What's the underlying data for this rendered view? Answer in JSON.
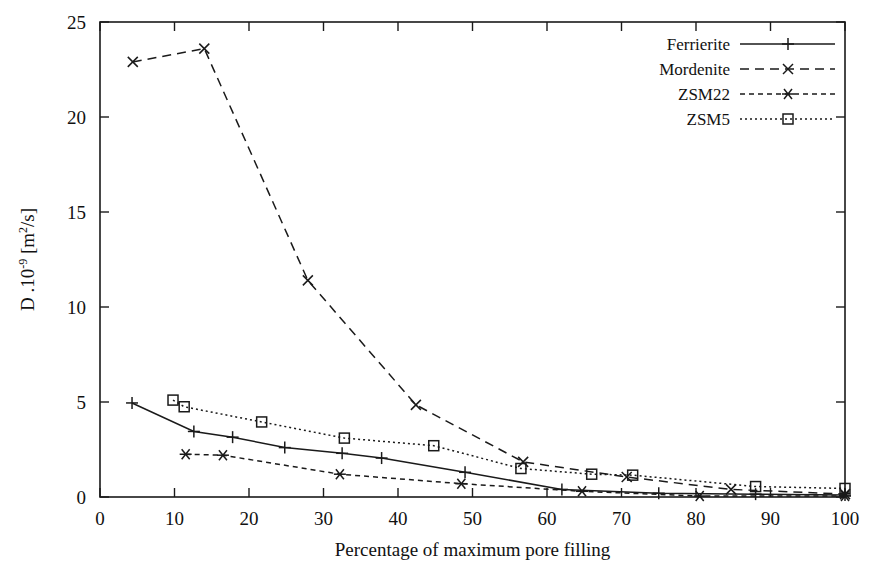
{
  "chart_data": {
    "type": "line",
    "title": "",
    "subtitle": "",
    "xlabel": "Percentage of maximum pore filling",
    "ylabel": "D .10-9 [m2/s]",
    "ylabel_parts": {
      "lead": "D .10",
      "exp": "-9",
      "tail": " [m",
      "unit_exp": "2",
      "unit_tail": "/s]"
    },
    "xlim": [
      0,
      100
    ],
    "ylim": [
      0,
      25
    ],
    "xticks": [
      0,
      10,
      20,
      30,
      40,
      50,
      60,
      70,
      80,
      90,
      100
    ],
    "yticks": [
      0,
      5,
      10,
      15,
      20,
      25
    ],
    "xtick_labels": [
      "0",
      "10",
      "20",
      "30",
      "40",
      "50",
      "60",
      "70",
      "80",
      "90",
      "100"
    ],
    "ytick_labels": [
      "0",
      "5",
      "10",
      "15",
      "20",
      "25"
    ],
    "grid": false,
    "legend_position": "top-right",
    "frame": true,
    "series": [
      {
        "name": "Ferrierite",
        "style": "solid",
        "marker": "plus",
        "color": "#1a1a1a",
        "x": [
          4.3,
          12.6,
          17.8,
          24.8,
          32.5,
          37.8,
          49.0,
          62.0,
          75.0,
          88.0,
          100.0
        ],
        "y": [
          4.95,
          3.45,
          3.15,
          2.6,
          2.3,
          2.05,
          1.3,
          0.4,
          0.2,
          0.15,
          0.1
        ]
      },
      {
        "name": "Mordenite",
        "style": "dashed",
        "marker": "cross",
        "color": "#1a1a1a",
        "x": [
          4.4,
          14.0,
          27.9,
          42.4,
          56.8,
          70.7,
          84.7,
          100.0
        ],
        "y": [
          22.9,
          23.6,
          11.4,
          4.85,
          1.85,
          1.05,
          0.4,
          0.15
        ]
      },
      {
        "name": "ZSM22",
        "style": "dashed-fine",
        "marker": "asterisk",
        "color": "#1a1a1a",
        "x": [
          11.5,
          16.5,
          32.2,
          48.5,
          64.7,
          80.5,
          100.0
        ],
        "y": [
          2.25,
          2.2,
          1.2,
          0.7,
          0.3,
          0.05,
          0.05
        ]
      },
      {
        "name": "ZSM5",
        "style": "dotted",
        "marker": "square",
        "color": "#1a1a1a",
        "x": [
          9.8,
          11.3,
          21.7,
          32.8,
          44.8,
          56.5,
          66.0,
          71.5,
          88.0,
          100.0
        ],
        "y": [
          5.1,
          4.75,
          3.95,
          3.1,
          2.7,
          1.5,
          1.2,
          1.15,
          0.55,
          0.45
        ]
      }
    ]
  },
  "legend": {
    "entries": [
      {
        "label": "Ferrierite"
      },
      {
        "label": "Mordenite"
      },
      {
        "label": "ZSM22"
      },
      {
        "label": "ZSM5"
      }
    ]
  }
}
